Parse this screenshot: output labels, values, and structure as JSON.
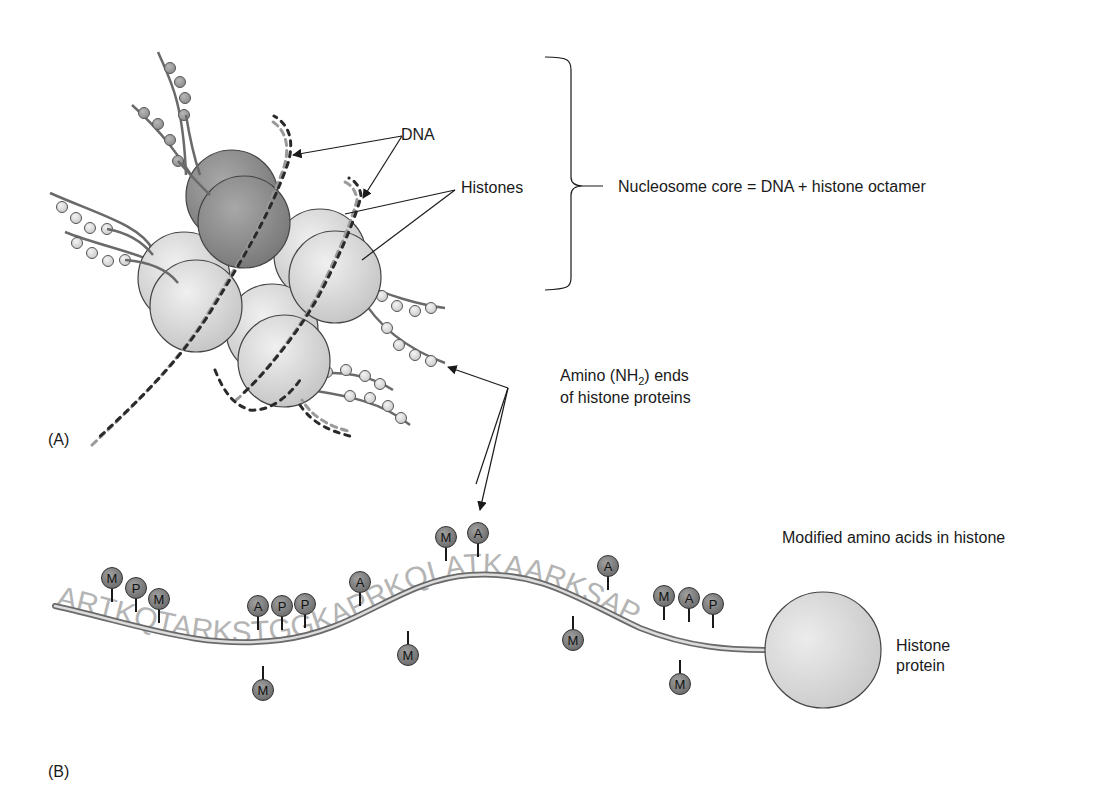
{
  "figure": {
    "panel_a": {
      "label": "(A)",
      "dna_label": "DNA",
      "histones_label": "Histones",
      "nucleosome_label": "Nucleosome core = DNA + histone octamer",
      "amino_label_line1_pre": "Amino (NH",
      "amino_label_sub": "2",
      "amino_label_line1_post": ") ends",
      "amino_label_line2": "of histone proteins"
    },
    "panel_b": {
      "label": "(B)",
      "modified_label": "Modified amino acids in histone",
      "histone_protein_line1": "Histone",
      "histone_protein_line2": "protein",
      "sequence": "ARTKQTARKSTGGKAPRKQLATKAARKSAP",
      "modifications": [
        {
          "letter": "M",
          "x": 112,
          "y": 578,
          "side": "top"
        },
        {
          "letter": "P",
          "x": 136,
          "y": 588,
          "side": "top"
        },
        {
          "letter": "M",
          "x": 159,
          "y": 599,
          "side": "top"
        },
        {
          "letter": "A",
          "x": 258,
          "y": 606,
          "side": "top"
        },
        {
          "letter": "P",
          "x": 282,
          "y": 606,
          "side": "top"
        },
        {
          "letter": "P",
          "x": 305,
          "y": 604,
          "side": "top"
        },
        {
          "letter": "M",
          "x": 263,
          "y": 690,
          "side": "bottom"
        },
        {
          "letter": "A",
          "x": 360,
          "y": 582,
          "side": "top"
        },
        {
          "letter": "M",
          "x": 408,
          "y": 655,
          "side": "bottom"
        },
        {
          "letter": "M",
          "x": 446,
          "y": 537,
          "side": "top"
        },
        {
          "letter": "A",
          "x": 478,
          "y": 533,
          "side": "top"
        },
        {
          "letter": "A",
          "x": 608,
          "y": 566,
          "side": "top"
        },
        {
          "letter": "M",
          "x": 573,
          "y": 640,
          "side": "bottom"
        },
        {
          "letter": "M",
          "x": 664,
          "y": 596,
          "side": "top"
        },
        {
          "letter": "A",
          "x": 689,
          "y": 598,
          "side": "top"
        },
        {
          "letter": "P",
          "x": 713,
          "y": 604,
          "side": "top"
        },
        {
          "letter": "M",
          "x": 680,
          "y": 684,
          "side": "bottom"
        }
      ]
    },
    "colors": {
      "text": "#1a1a1a",
      "histone_dark": "#8c8c8c",
      "histone_light": "#d6d6d6",
      "dna_dark": "#2a2a2a",
      "dna_light": "#9a9a9a",
      "sequence_text": "#b4b4b4",
      "mod_bead": "#7d7d7d"
    }
  }
}
